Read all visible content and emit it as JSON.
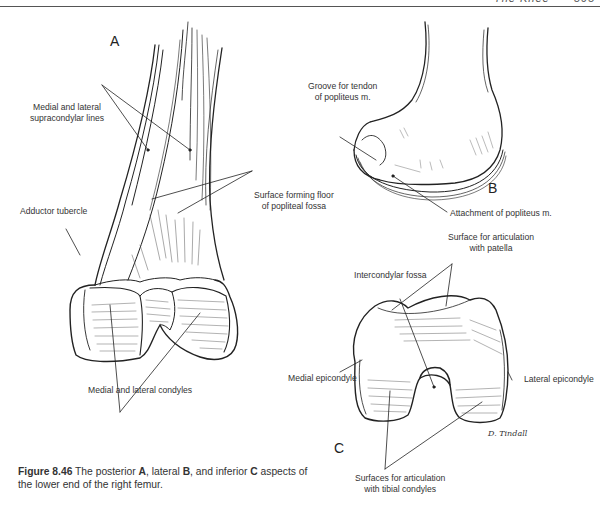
{
  "running_head": {
    "title": "The Knee",
    "page": "595"
  },
  "panels": {
    "a": "A",
    "b": "B",
    "c": "C"
  },
  "labels": {
    "supracondylar_1": "Medial and lateral",
    "supracondylar_2": "supracondylar lines",
    "adductor_tubercle": "Adductor tubercle",
    "popliteal_floor_1": "Surface forming floor",
    "popliteal_floor_2": "of popliteal fossa",
    "condyles": "Medial and lateral condyles",
    "groove_1": "Groove for tendon",
    "groove_2": "of popliteus m.",
    "popliteus_attachment": "Attachment of popliteus m.",
    "patella_surface_1": "Surface for articulation",
    "patella_surface_2": "with patella",
    "intercondylar_fossa": "Intercondylar fossa",
    "medial_epicondyle": "Medial epicondyle",
    "lateral_epicondyle": "Lateral epicondyle",
    "tibial_surfaces_1": "Surfaces for articulation",
    "tibial_surfaces_2": "with tibial condyles",
    "signature": "D. Tindall"
  },
  "caption": {
    "figure_label": "Figure 8.46",
    "t1": " The posterior ",
    "a": "A",
    "t2": ", lateral ",
    "b": "B",
    "t3": ", and inferior ",
    "c": "C",
    "t4": " aspects of the lower end of the right femur."
  }
}
